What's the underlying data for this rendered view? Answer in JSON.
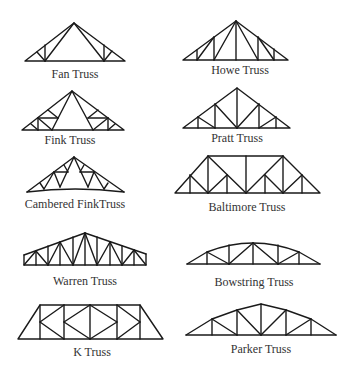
{
  "trusses": [
    {
      "id": "fan",
      "label": "Fan Truss",
      "column": "left",
      "row": 1
    },
    {
      "id": "howe",
      "label": "Howe Truss",
      "column": "right",
      "row": 1
    },
    {
      "id": "fink",
      "label": "Fink Truss",
      "column": "left",
      "row": 2
    },
    {
      "id": "pratt",
      "label": "Pratt Truss",
      "column": "right",
      "row": 2
    },
    {
      "id": "cambered-fink",
      "label": "Cambered FinkTruss",
      "column": "left",
      "row": 3
    },
    {
      "id": "baltimore",
      "label": "Baltimore Truss",
      "column": "right",
      "row": 3
    },
    {
      "id": "warren",
      "label": "Warren Truss",
      "column": "left",
      "row": 4
    },
    {
      "id": "bowstring",
      "label": "Bowstring Truss",
      "column": "right",
      "row": 4
    },
    {
      "id": "k",
      "label": "K Truss",
      "column": "left",
      "row": 5
    },
    {
      "id": "parker",
      "label": "Parker Truss",
      "column": "right",
      "row": 5
    }
  ],
  "colors": {
    "line": "#1a1a1a",
    "text": "#333333",
    "background": "#ffffff"
  }
}
